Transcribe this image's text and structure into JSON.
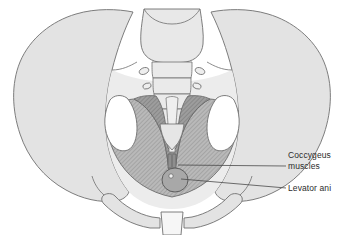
{
  "figure": {
    "type": "anatomical-illustration",
    "background_color": "#ffffff"
  },
  "labels": [
    {
      "id": "coccygeus",
      "line1": "Coccygeus",
      "line2": "muscles",
      "leader_from_x": 288,
      "leader_from_y": 166,
      "leader_to_x": 178,
      "leader_to_y": 165
    },
    {
      "id": "levator",
      "line1": "Levator ani",
      "line2": "",
      "leader_from_x": 288,
      "leader_from_y": 188,
      "leader_to_x": 181,
      "leader_to_y": 179
    }
  ],
  "colors": {
    "bone_fill": "#e3e3e3",
    "bone_outline": "#6f6f6f",
    "coccygeus_fill": "#b5b5b5",
    "levator_fill": "#9a9a9a",
    "foramen_fill": "#ffffff",
    "symphysis_fill": "#f4f4f4",
    "leader_line": "#4a4a4a",
    "text": "#2b2b2b",
    "sacrum_fill": "#e8e8e8"
  },
  "structures": {
    "iliac_wings": "Iliac wings (left and right)",
    "sacrum": "Sacrum with vertebral segments",
    "sacral_foramina": "Sacral foramina",
    "coccyx": "Coccyx",
    "obturator_openings": "Obturator openings (left and right)",
    "pubic_symphysis": "Pubic symphysis",
    "pelvic_floor": "Pelvic floor muscle sheet",
    "anal_canal": "Anal canal opening"
  }
}
